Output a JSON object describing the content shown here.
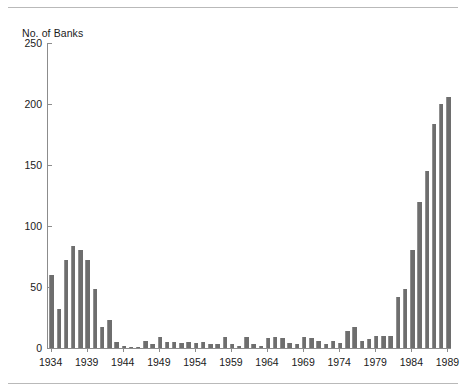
{
  "chart_data": {
    "type": "bar",
    "title": "",
    "subtitle": "",
    "ylabel": "No. of Banks",
    "xlabel": "",
    "ylim": [
      0,
      250
    ],
    "yticks": [
      0,
      50,
      100,
      150,
      200,
      250
    ],
    "xtick_labels": [
      "1934",
      "1939",
      "1944",
      "1949",
      "1954",
      "1959",
      "1964",
      "1969",
      "1974",
      "1979",
      "1984",
      "1989"
    ],
    "grid": false,
    "legend": null,
    "bar_color": "#6e6e6e",
    "categories": [
      "1934",
      "1935",
      "1936",
      "1937",
      "1938",
      "1939",
      "1940",
      "1941",
      "1942",
      "1943",
      "1944",
      "1945",
      "1946",
      "1947",
      "1948",
      "1949",
      "1950",
      "1951",
      "1952",
      "1953",
      "1954",
      "1955",
      "1956",
      "1957",
      "1958",
      "1959",
      "1960",
      "1961",
      "1962",
      "1963",
      "1964",
      "1965",
      "1966",
      "1967",
      "1968",
      "1969",
      "1970",
      "1971",
      "1972",
      "1973",
      "1974",
      "1975",
      "1976",
      "1977",
      "1978",
      "1979",
      "1980",
      "1981",
      "1982",
      "1983",
      "1984",
      "1985",
      "1986",
      "1987",
      "1988",
      "1989"
    ],
    "values": [
      60,
      32,
      72,
      84,
      80,
      72,
      48,
      17,
      23,
      5,
      2,
      1,
      1,
      6,
      3,
      9,
      5,
      5,
      4,
      5,
      4,
      5,
      3,
      3,
      9,
      3,
      2,
      9,
      3,
      2,
      8,
      9,
      8,
      4,
      3,
      9,
      8,
      6,
      3,
      6,
      4,
      14,
      17,
      6,
      7,
      10,
      10,
      10,
      42,
      48,
      80,
      120,
      145,
      184,
      200,
      206
    ]
  }
}
